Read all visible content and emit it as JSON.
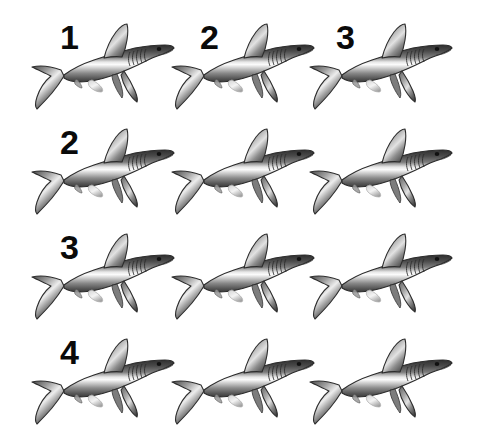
{
  "image": {
    "title": "Shark counting grid",
    "background_color": "#ffffff",
    "width": 503,
    "height": 437,
    "grid_rows": 4,
    "grid_columns": 3,
    "subject": "shark",
    "subject_count": 12,
    "subject_color": "#8a8a8a",
    "label_color": "#0a0a0a",
    "label_font_size": "34px"
  },
  "rows": [
    {
      "index": 1,
      "top": 8,
      "labels": [
        {
          "text": "1",
          "x": 60,
          "y": 20
        },
        {
          "text": "2",
          "x": 200,
          "y": 20
        },
        {
          "text": "3",
          "x": 336,
          "y": 20
        }
      ],
      "sharks": [
        {
          "x": 18,
          "y": 8
        },
        {
          "x": 158,
          "y": 8
        },
        {
          "x": 296,
          "y": 8
        }
      ]
    },
    {
      "index": 2,
      "top": 113,
      "labels": [
        {
          "text": "2",
          "x": 60,
          "y": 125
        }
      ],
      "sharks": [
        {
          "x": 18,
          "y": 113
        },
        {
          "x": 158,
          "y": 113
        },
        {
          "x": 296,
          "y": 113
        }
      ]
    },
    {
      "index": 3,
      "top": 218,
      "labels": [
        {
          "text": "3",
          "x": 60,
          "y": 230
        }
      ],
      "sharks": [
        {
          "x": 18,
          "y": 218
        },
        {
          "x": 158,
          "y": 218
        },
        {
          "x": 296,
          "y": 218
        }
      ]
    },
    {
      "index": 4,
      "top": 323,
      "labels": [
        {
          "text": "4",
          "x": 60,
          "y": 335
        }
      ],
      "sharks": [
        {
          "x": 18,
          "y": 323
        },
        {
          "x": 158,
          "y": 323
        },
        {
          "x": 296,
          "y": 323
        }
      ]
    }
  ],
  "shark": {
    "name": "shark-illustration",
    "facing": "right",
    "body_top_color": "#3d3d3d",
    "body_mid_color": "#f2f2f2",
    "body_bottom_color": "#585858",
    "outline_color": "#2b2b2b",
    "eye_color": "#111111",
    "features": [
      "dorsal-fin",
      "pectoral-fin",
      "pelvic-fin",
      "anal-fin",
      "caudal-fin",
      "gill-slits",
      "eye",
      "snout"
    ]
  }
}
